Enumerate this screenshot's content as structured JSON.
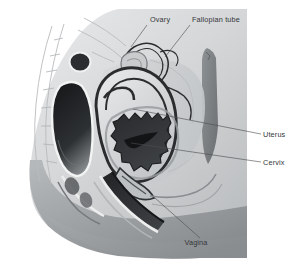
{
  "figure": {
    "view": "sagittal (side) section",
    "style": "grayscale medical illustration",
    "canvas": {
      "width": 302,
      "height": 271
    },
    "background_color": "#ffffff"
  },
  "palette": {
    "background": "#ffffff",
    "body_light": "#dcdedf",
    "body_mid": "#c6c8ca",
    "body_shadow": "#9a9da0",
    "body_dark": "#7e8184",
    "organ_pale": "#e3e4e5",
    "organ_grey": "#b2b5b7",
    "organ_mid_grey": "#9b9ea1",
    "cavity_dark": "#3a3c3f",
    "cavity_black": "#1d1f21",
    "outline": "#2a2c2e",
    "leader_line": "#4b4e52",
    "label_text": "#34373a",
    "faint_line": "#b9bbbd"
  },
  "labels": [
    {
      "id": "ovary",
      "text": "Ovary",
      "x": 150,
      "y": 22,
      "anchor": "start",
      "leader": "M 147 25 L 131 47",
      "target": "ovary-structure"
    },
    {
      "id": "fallopian-tube",
      "text": "Fallopian tube",
      "x": 192,
      "y": 22,
      "anchor": "start",
      "leader": "M 190 25 L 165 57",
      "target": "fallopian-tube-structure"
    },
    {
      "id": "uterus",
      "text": "Uterus",
      "x": 263,
      "y": 137,
      "anchor": "start",
      "leader": "M 261 134 L 133 109",
      "target": "uterus-structure"
    },
    {
      "id": "cervix",
      "text": "Cervix",
      "x": 263,
      "y": 165,
      "anchor": "start",
      "leader": "M 261 162 L 131 143",
      "target": "cervix-structure"
    },
    {
      "id": "vagina",
      "text": "Vagina",
      "x": 196,
      "y": 245,
      "anchor": "middle",
      "leader": "M 200 238 L 155 198",
      "target": "vagina-structure"
    }
  ],
  "structures": [
    {
      "id": "ovary-structure",
      "name": "Ovary",
      "description": "small lobed oval organ near the uterine fundus"
    },
    {
      "id": "fallopian-tube-structure",
      "name": "Fallopian tube",
      "description": "slender tube curving from uterus over the ovary"
    },
    {
      "id": "uterus-structure",
      "name": "Uterus",
      "description": "pear-shaped muscular organ with thick dark outline"
    },
    {
      "id": "cervix-structure",
      "name": "Cervix",
      "description": "lower narrow neck of the uterus opening into vagina"
    },
    {
      "id": "vagina-structure",
      "name": "Vagina",
      "description": "dark diagonal canal running down and forward"
    },
    {
      "id": "endometrial-cavity",
      "name": "Endometrial cavity",
      "description": "jagged serrated dark uterine lining cavity"
    },
    {
      "id": "bladder-structure",
      "name": "Bladder",
      "description": "dark rounded cavity anterior to the uterus"
    },
    {
      "id": "sacrum-structure",
      "name": "Sacrum and spine",
      "description": "segmented vertebral column at the posterior left"
    },
    {
      "id": "rectum-structure",
      "name": "Rectum",
      "description": "vertical darker band at the posterior right"
    },
    {
      "id": "pubic-bone-structure",
      "name": "Pubic bone",
      "description": "rounded bone anterior to the bladder"
    },
    {
      "id": "body-outline",
      "name": "Body contour",
      "description": "abdominal wall, buttock and thigh silhouette"
    }
  ]
}
